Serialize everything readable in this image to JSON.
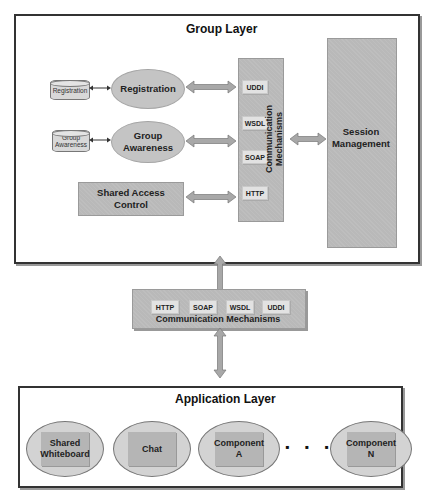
{
  "group_layer": {
    "title": "Group Layer",
    "registration_db": "Registration",
    "registration": "Registration",
    "group_awareness_db": "Group Awareness",
    "group_awareness": "Group Awareness",
    "shared_access_control": "Shared Access Control",
    "comm_mechanisms": {
      "label": "Communication Mechanisms",
      "protocols": [
        "UDDI",
        "WSDL",
        "SOAP",
        "HTTP"
      ]
    },
    "session_management": "Session Management"
  },
  "middle_comm": {
    "label": "Communication Mechanisms",
    "protocols": [
      "HTTP",
      "SOAP",
      "WSDL",
      "UDDI"
    ]
  },
  "application_layer": {
    "title": "Application Layer",
    "components": [
      "Shared Whiteboard",
      "Chat",
      "Component A",
      "Component N"
    ],
    "ellipsis": "▪ ▪ ▪"
  },
  "colors": {
    "box_fill": "#b9b9b9",
    "oval_fill": "#c4c4c4",
    "arrow_fill": "#a8a8a8",
    "border": "#333333"
  }
}
